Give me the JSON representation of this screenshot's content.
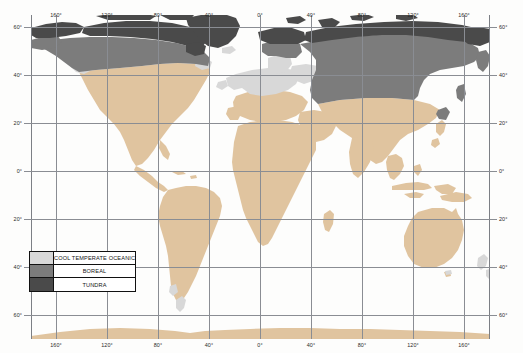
{
  "map": {
    "title": "World map of cool temperate oceanic, boreal and tundra zones",
    "projection": "equirectangular",
    "background_color": "#fdfdfc",
    "grid_color": "#8a8d93",
    "x_axis": {
      "labels_top": [
        "160°",
        "120°",
        "80°",
        "40°",
        "0°",
        "40°",
        "80°",
        "120°",
        "160°"
      ],
      "labels_bottom": [
        "160°",
        "120°",
        "80°",
        "40°",
        "0°",
        "40°",
        "80°",
        "120°",
        "160°"
      ],
      "values": [
        -160,
        -120,
        -80,
        -40,
        0,
        40,
        80,
        120,
        160
      ],
      "range": [
        -180,
        180
      ]
    },
    "y_axis": {
      "labels_left": [
        "60°",
        "40°",
        "20°",
        "0°",
        "20°",
        "40°",
        "60°"
      ],
      "labels_right": [
        "60°",
        "40°",
        "20°",
        "0°",
        "20°",
        "40°",
        "60°"
      ],
      "values": [
        60,
        40,
        20,
        0,
        -20,
        -40,
        -60
      ],
      "range": [
        80,
        -78
      ]
    }
  },
  "legend": {
    "rows": [
      {
        "label": "COOL TEMPERATE OCEANIC",
        "color": "#d8d8d8"
      },
      {
        "label": "BOREAL",
        "color": "#7c7c7c"
      },
      {
        "label": "TUNDRA",
        "color": "#4a4a4a"
      }
    ]
  },
  "colors": {
    "other_land": "#e0c49f",
    "cool_temperate_oceanic": "#d8d8d8",
    "boreal": "#7c7c7c",
    "tundra": "#4a4a4a",
    "ocean": "#ffffff",
    "grid": "#8a8d93",
    "text": "#2a2a2a"
  }
}
